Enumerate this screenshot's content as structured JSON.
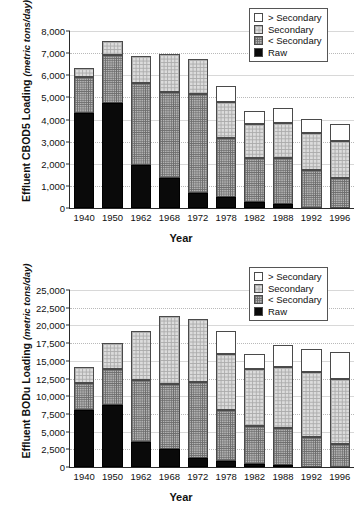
{
  "charts": [
    {
      "id": "cbod5",
      "ylabel_main": "Effluent CBOD5 Loading",
      "ylabel_unit": "(metric tons/day)",
      "xlabel": "Year",
      "legend": [
        {
          "key": "gt",
          "label": "> Secondary"
        },
        {
          "key": "sec",
          "label": "Secondary"
        },
        {
          "key": "lt",
          "label": "< Secondary"
        },
        {
          "key": "raw",
          "label": "Raw"
        }
      ],
      "chart_data": {
        "type": "bar",
        "stacked": true,
        "title": "",
        "xlabel": "Year",
        "ylabel": "Effluent CBOD5 Loading (metric tons/day)",
        "ylim": [
          0,
          8000
        ],
        "yticks": [
          "0",
          "1,000",
          "2,000",
          "3,000",
          "4,000",
          "5,000",
          "6,000",
          "7,000",
          "8,000"
        ],
        "ytick_values": [
          0,
          1000,
          2000,
          3000,
          4000,
          5000,
          6000,
          7000,
          8000
        ],
        "grid": true,
        "legend_position": "top-right",
        "categories": [
          "1940",
          "1950",
          "1962",
          "1968",
          "1972",
          "1978",
          "1982",
          "1988",
          "1992",
          "1996"
        ],
        "series": [
          {
            "name": "Raw",
            "values": [
              4300,
              4750,
              1960,
              1370,
              660,
              500,
              260,
              200,
              0,
              0
            ]
          },
          {
            "name": "< Secondary",
            "values": [
              1640,
              2150,
              3700,
              3880,
              4500,
              2670,
              1990,
              2060,
              1700,
              1370
            ]
          },
          {
            "name": "Secondary",
            "values": [
              400,
              660,
              1220,
              1690,
              1590,
              1600,
              1530,
              1570,
              1680,
              1640
            ]
          },
          {
            "name": "> Secondary",
            "values": [
              0,
              0,
              0,
              0,
              0,
              760,
              620,
              670,
              660,
              810
            ]
          }
        ],
        "totals": [
          6340,
          7560,
          6880,
          6940,
          6750,
          5530,
          4400,
          4500,
          4040,
          3820
        ]
      }
    },
    {
      "id": "bodu",
      "ylabel_main": "Effluent BODu Loading",
      "ylabel_unit": "(metric tons/day)",
      "xlabel": "Year",
      "legend": [
        {
          "key": "gt",
          "label": "> Secondary"
        },
        {
          "key": "sec",
          "label": "Secondary"
        },
        {
          "key": "lt",
          "label": "< Secondary"
        },
        {
          "key": "raw",
          "label": "Raw"
        }
      ],
      "chart_data": {
        "type": "bar",
        "stacked": true,
        "title": "",
        "xlabel": "Year",
        "ylabel": "Effluent BODu Loading (metric tons/day)",
        "ylim": [
          0,
          25000
        ],
        "yticks": [
          "0",
          "2,500",
          "5,000",
          "7,500",
          "10,000",
          "12,500",
          "15,000",
          "17,500",
          "20,000",
          "22,500",
          "25,000"
        ],
        "ytick_values": [
          0,
          2500,
          5000,
          7500,
          10000,
          12500,
          15000,
          17500,
          20000,
          22500,
          25000
        ],
        "grid": true,
        "legend_position": "top-right",
        "categories": [
          "1940",
          "1950",
          "1962",
          "1968",
          "1972",
          "1978",
          "1982",
          "1988",
          "1992",
          "1996"
        ],
        "series": [
          {
            "name": "Raw",
            "values": [
              8000,
              8700,
              3550,
              2500,
              1250,
              900,
              450,
              300,
              0,
              0
            ]
          },
          {
            "name": "< Secondary",
            "values": [
              3850,
              5150,
              8800,
              9250,
              10750,
              7200,
              5400,
              5200,
              4200,
              3300
            ]
          },
          {
            "name": "Secondary",
            "values": [
              2250,
              3700,
              6900,
              9650,
              8900,
              7900,
              8050,
              8650,
              9250,
              9200
            ]
          },
          {
            "name": "> Secondary",
            "values": [
              0,
              0,
              0,
              0,
              0,
              3200,
              2000,
              3050,
              3250,
              3800
            ]
          }
        ],
        "totals": [
          14100,
          17550,
          19250,
          21400,
          20900,
          19200,
          15900,
          17200,
          16700,
          16300
        ]
      }
    }
  ]
}
